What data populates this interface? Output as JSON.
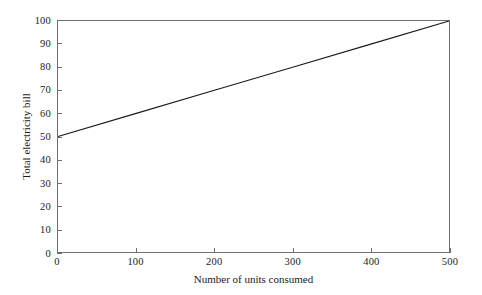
{
  "figure": {
    "background_color": "#ffffff",
    "frame_color": "#6f6f6f",
    "line_color": "#1a1a1a"
  },
  "axes": {
    "y_title": "Total electricity bill",
    "x_title": "Number of units consumed",
    "y_ticks": [
      "0",
      "10",
      "20",
      "30",
      "40",
      "50",
      "60",
      "70",
      "80",
      "90",
      "100"
    ],
    "x_ticks": [
      "0",
      "100",
      "200",
      "300",
      "400",
      "500"
    ]
  },
  "chart_data": {
    "type": "line",
    "title": "",
    "subtitle": "",
    "xlabel": "Number of units consumed",
    "ylabel": "Total electricity bill",
    "xlim": [
      0,
      500
    ],
    "ylim": [
      0,
      100
    ],
    "xticks": [
      0,
      100,
      200,
      300,
      400,
      500
    ],
    "yticks": [
      0,
      10,
      20,
      30,
      40,
      50,
      60,
      70,
      80,
      90,
      100
    ],
    "grid": false,
    "legend": null,
    "legend_position": "none",
    "annotations": [],
    "series": [
      {
        "name": "Total electricity bill",
        "x": [
          0,
          100,
          200,
          300,
          400,
          500
        ],
        "values": [
          50,
          60,
          70,
          80,
          90,
          100
        ],
        "color": "#1a1a1a",
        "linewidth": 1.8,
        "markers": false,
        "relationship": "bill = 50 + 0.1 * units",
        "intercept": 50,
        "slope": 0.1,
        "endpoints": [
          [
            0,
            50
          ],
          [
            500,
            100
          ]
        ]
      }
    ]
  }
}
